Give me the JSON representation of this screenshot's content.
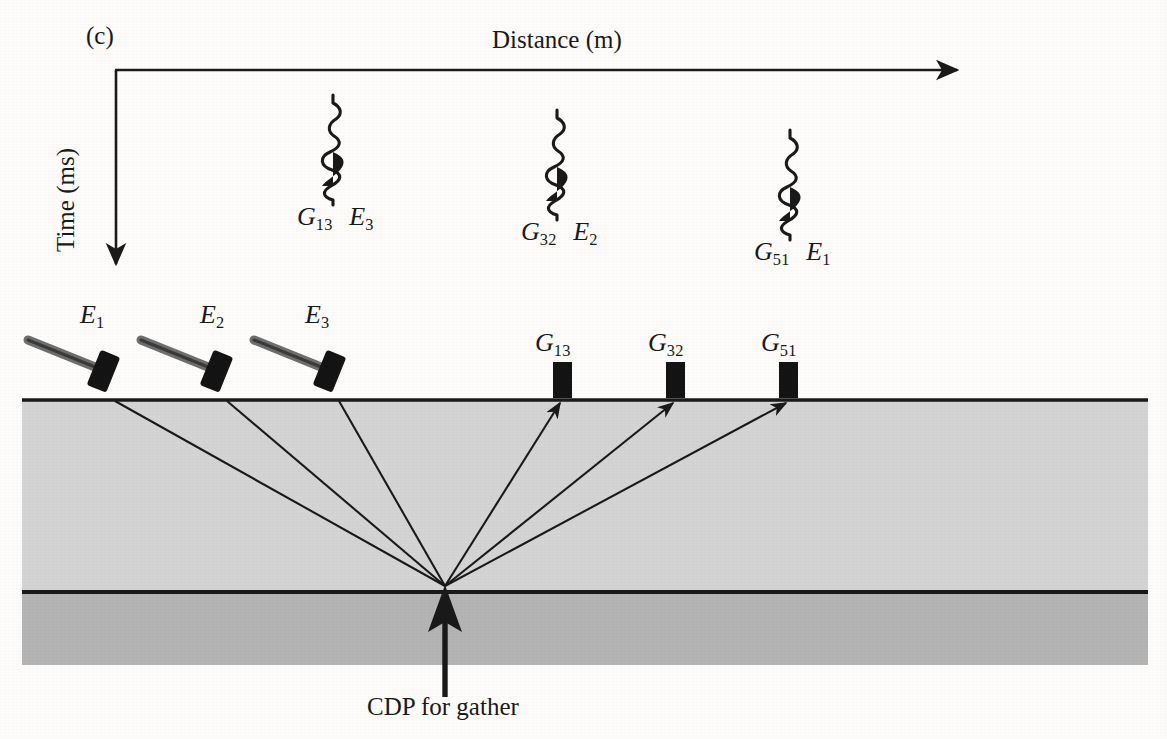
{
  "figure": {
    "panel_id": "(c)",
    "axis_x_title": "Distance (m)",
    "axis_y_title": "Time (ms)",
    "cdp_caption": "CDP for gather",
    "colors": {
      "background": "#fdfcfa",
      "ink": "#1a1a1a",
      "layer_upper": "#d4d4d4",
      "layer_lower": "#b4b4b4",
      "hammer_handle": "#6e6e6e",
      "hammer_head": "#141414",
      "geophone": "#141414"
    }
  },
  "traces": [
    {
      "id": "trace-1",
      "geophone_label": "G",
      "geophone_sub": "13",
      "source_label": "E",
      "source_sub": "3",
      "label_text": "G13 E3",
      "x": 333,
      "top": 95,
      "bottom": 205
    },
    {
      "id": "trace-2",
      "geophone_label": "G",
      "geophone_sub": "32",
      "source_label": "E",
      "source_sub": "2",
      "label_text": "G32 E2",
      "x": 557,
      "top": 110,
      "bottom": 220
    },
    {
      "id": "trace-3",
      "geophone_label": "G",
      "geophone_sub": "51",
      "source_label": "E",
      "source_sub": "1",
      "label_text": "G51 E1",
      "x": 790,
      "top": 130,
      "bottom": 240
    }
  ],
  "sources": [
    {
      "id": "source-E1",
      "label": "E",
      "sub": "1",
      "x": 105,
      "label_x": 80,
      "label_y": 300
    },
    {
      "id": "source-E2",
      "label": "E",
      "sub": "2",
      "x": 218,
      "label_x": 200,
      "label_y": 300
    },
    {
      "id": "source-E3",
      "label": "E",
      "sub": "3",
      "x": 331,
      "label_x": 305,
      "label_y": 300
    }
  ],
  "receivers": [
    {
      "id": "receiver-G13",
      "label": "G",
      "sub": "13",
      "x": 562,
      "label_x": 537,
      "label_y": 328
    },
    {
      "id": "receiver-G32",
      "label": "G",
      "sub": "32",
      "x": 675,
      "label_x": 650,
      "label_y": 328
    },
    {
      "id": "receiver-G51",
      "label": "G",
      "sub": "51",
      "x": 788,
      "label_x": 763,
      "label_y": 328
    }
  ],
  "geometry": {
    "axis_corner_x": 115,
    "axis_corner_y": 70,
    "axis_x_end": 965,
    "axis_y_end": 272,
    "surface_y": 400,
    "reflector_y": 592,
    "layer_bottom_y": 665,
    "layer_left_x": 22,
    "layer_right_x": 1148,
    "cdp_x": 445,
    "cdp_y": 588,
    "cdp_arrow_tail_y": 697,
    "cdp_label_x": 368,
    "cdp_label_y": 692
  },
  "raypaths": {
    "down_from": [
      115,
      227,
      339
    ],
    "up_to": [
      562,
      675,
      788
    ]
  }
}
